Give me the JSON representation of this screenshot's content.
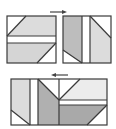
{
  "diagram": {
    "colors": {
      "outline": "#3a3a3a",
      "light_gray": "#dcdcdc",
      "mid_gray": "#bdbdbd",
      "dark_gray": "#a9a9a9",
      "very_light": "#ececec",
      "white": "#ffffff"
    },
    "arrows": [
      {
        "name": "top-arrow",
        "direction": "right"
      },
      {
        "name": "bottom-arrow",
        "direction": "left"
      }
    ],
    "units": [
      {
        "name": "top-left-square",
        "pieces": 4
      },
      {
        "name": "top-right-square",
        "pieces": 5
      },
      {
        "name": "bottom-rectangle",
        "pieces": 8
      }
    ]
  }
}
